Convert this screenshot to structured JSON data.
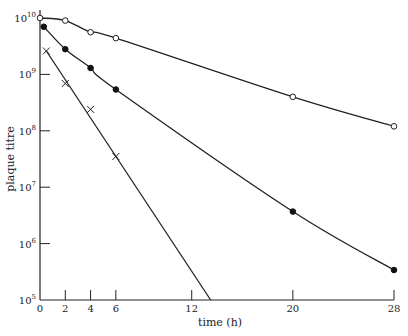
{
  "chart_data": {
    "type": "line",
    "title": "",
    "xlabel": "time (h)",
    "ylabel": "plaque titre",
    "yscale": "log",
    "xlim": [
      0,
      28
    ],
    "ylim": [
      100000,
      10000000000
    ],
    "x_ticks": [
      0,
      2,
      4,
      6,
      12,
      20,
      28
    ],
    "x_tick_labels": [
      "0",
      "2",
      "4",
      "6",
      "12",
      "20",
      "28"
    ],
    "y_ticks": [
      100000,
      1000000,
      10000000,
      100000000,
      1000000000,
      10000000000
    ],
    "y_tick_labels": [
      {
        "base": "10",
        "exp": "5"
      },
      {
        "base": "10",
        "exp": "6"
      },
      {
        "base": "10",
        "exp": "7"
      },
      {
        "base": "10",
        "exp": "8"
      },
      {
        "base": "10",
        "exp": "9"
      },
      {
        "base": "10",
        "exp": "10"
      }
    ],
    "grid": false,
    "legend": null,
    "series": [
      {
        "name": "open circles",
        "marker": "open-circle",
        "x": [
          0,
          2,
          4,
          6,
          20,
          28
        ],
        "values": [
          10000000000,
          9000000000,
          5600000000,
          4400000000,
          400000000,
          120000000
        ]
      },
      {
        "name": "filled circles",
        "marker": "filled-circle",
        "x": [
          0.3,
          2,
          4,
          6,
          20,
          28
        ],
        "values": [
          7000000000,
          2800000000,
          1300000000,
          540000000,
          3700000,
          340000
        ]
      },
      {
        "name": "crosses",
        "marker": "cross",
        "x": [
          0.5,
          2,
          4,
          6
        ],
        "values": [
          2600000000,
          690000000,
          240000000,
          35000000
        ],
        "fit_line_to": [
          13.5,
          100000
        ]
      }
    ]
  },
  "labels": {
    "xlabel": "time (h)",
    "ylabel": "plaque titre"
  }
}
